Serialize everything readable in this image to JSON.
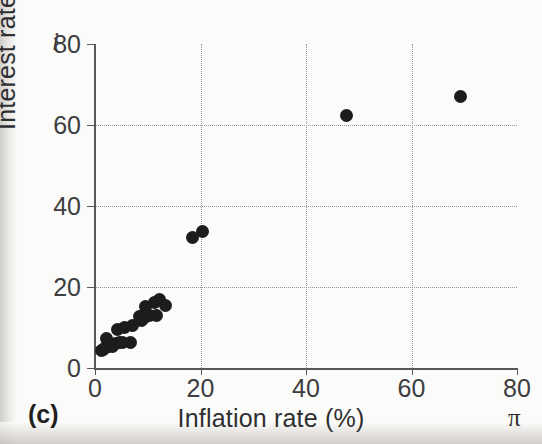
{
  "figure": {
    "panel_label": "(c)",
    "background_color": "#fbfbfa",
    "marker_color": "#1c1c1c",
    "axis_color": "#58585a",
    "grid_color": "#9b9a98"
  },
  "axes": {
    "y_symbol": "i",
    "x_symbol": "π",
    "x_title": "Inflation rate (%)",
    "y_title": "Interest rate (%)",
    "x_ticks": [
      "0",
      "20",
      "40",
      "60",
      "80"
    ],
    "y_ticks": [
      "0",
      "20",
      "40",
      "60",
      "80"
    ]
  },
  "chart_data": {
    "type": "scatter",
    "title": "",
    "xlabel": "Inflation rate (%)",
    "ylabel": "Interest rate (%)",
    "xlim": [
      0,
      80
    ],
    "ylim": [
      0,
      80
    ],
    "xticks": [
      0,
      20,
      40,
      60,
      80
    ],
    "yticks": [
      0,
      20,
      40,
      60,
      80
    ],
    "grid": true,
    "grid_style": "dotted",
    "legend": "none",
    "x_axis_symbol": "π",
    "y_axis_symbol": "i",
    "panel_label": "(c)",
    "series": [
      {
        "name": "Countries",
        "marker": "filled-circle",
        "color": "#1c1c1c",
        "points": [
          [
            1.2,
            4.2
          ],
          [
            1.6,
            4.6
          ],
          [
            2.0,
            5.0
          ],
          [
            2.2,
            7.4
          ],
          [
            2.6,
            5.2
          ],
          [
            3.0,
            5.6
          ],
          [
            3.4,
            5.4
          ],
          [
            3.9,
            6.1
          ],
          [
            4.3,
            9.4
          ],
          [
            4.6,
            6.3
          ],
          [
            5.2,
            6.4
          ],
          [
            5.6,
            10.0
          ],
          [
            6.8,
            6.2
          ],
          [
            7.2,
            10.6
          ],
          [
            8.4,
            12.8
          ],
          [
            8.8,
            11.8
          ],
          [
            9.0,
            13.0
          ],
          [
            9.2,
            12.2
          ],
          [
            9.6,
            15.2
          ],
          [
            10.4,
            13.0
          ],
          [
            11.2,
            16.2
          ],
          [
            11.6,
            12.9
          ],
          [
            12.2,
            17.0
          ],
          [
            13.4,
            15.4
          ],
          [
            18.4,
            32.1
          ],
          [
            20.4,
            33.7
          ],
          [
            47.6,
            62.4
          ],
          [
            69.2,
            67.0
          ]
        ]
      }
    ]
  }
}
